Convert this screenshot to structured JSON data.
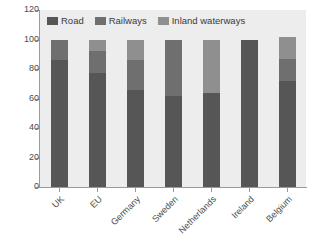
{
  "chart_data": {
    "type": "bar",
    "subtype": "stacked-vertical",
    "title": "",
    "xlabel": "",
    "ylabel": "",
    "ylim": [
      0,
      120
    ],
    "yticks": [
      0,
      20,
      40,
      60,
      80,
      100,
      120
    ],
    "ytick_labels": [
      "0",
      "20",
      "40",
      "60",
      "80",
      "100",
      "120"
    ],
    "grid": false,
    "legend_position": "top-left-inside",
    "categories": [
      "UK",
      "EU",
      "Germany",
      "Sweden",
      "Netherlands",
      "Ireland",
      "Belgium"
    ],
    "series": [
      {
        "name": "Road",
        "color": "#565656",
        "values": [
          86,
          77,
          66,
          62,
          64,
          100,
          72
        ]
      },
      {
        "name": "Railways",
        "color": "#6f6f6f",
        "values": [
          14,
          15,
          20,
          38,
          0,
          0,
          15
        ]
      },
      {
        "name": "Inland waterways",
        "color": "#8f8f8f",
        "values": [
          0,
          8,
          14,
          0,
          36,
          0,
          15
        ]
      }
    ],
    "totals": [
      100,
      100,
      100,
      100,
      100,
      100,
      102
    ],
    "colors": {
      "road": "#565656",
      "railways": "#6f6f6f",
      "inland_waterways": "#8f8f8f",
      "plot_background": "#ededed",
      "axis": "#9a9a9a",
      "text": "#4c4c4c"
    }
  },
  "legend": {
    "items": [
      {
        "label": "Road",
        "swatch": "legend-swatch-road"
      },
      {
        "label": "Railways",
        "swatch": "legend-swatch-railways"
      },
      {
        "label": "Inland waterways",
        "swatch": "legend-swatch-inland-waterways"
      }
    ]
  }
}
